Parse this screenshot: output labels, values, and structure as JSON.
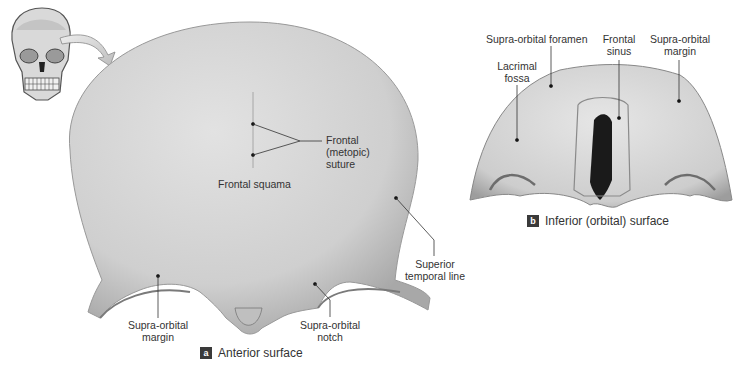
{
  "figure": {
    "panel_a": {
      "badge": "a",
      "caption": "Anterior surface",
      "labels": {
        "frontal_suture": [
          "Frontal",
          "(metopic)",
          "suture"
        ],
        "frontal_squama": "Frontal squama",
        "superior_temporal_line": [
          "Superior",
          "temporal line"
        ],
        "supra_orbital_margin": [
          "Supra-orbital",
          "margin"
        ],
        "supra_orbital_notch": [
          "Supra-orbital",
          "notch"
        ]
      }
    },
    "panel_b": {
      "badge": "b",
      "caption": "Inferior (orbital) surface",
      "labels": {
        "supra_orbital_foramen": "Supra-orbital foramen",
        "lacrimal_fossa": [
          "Lacrimal",
          "fossa"
        ],
        "frontal_sinus": [
          "Frontal",
          "sinus"
        ],
        "supra_orbital_margin": [
          "Supra-orbital",
          "margin"
        ]
      }
    },
    "colors": {
      "bone": "#d2d2d2",
      "bone_shadow": "#a9a9a9",
      "leader": "#333333",
      "badge": "#3a3a3a",
      "arrow": "#cfcfcf"
    }
  }
}
